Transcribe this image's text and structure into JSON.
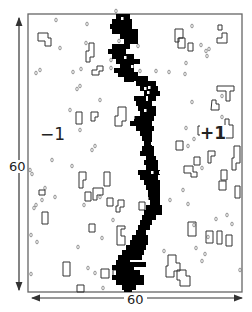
{
  "figure": {
    "width_label": "60",
    "height_label": "60",
    "left_region_label": "−1",
    "right_region_label": "+1",
    "frame": {
      "x": 28,
      "y": 14,
      "w": 214,
      "h": 278
    },
    "colors": {
      "frame": "#666666",
      "cluster": "#000000",
      "outline": "#333333",
      "dot": "#777777",
      "arrow": "#333333"
    }
  },
  "cluster_cells": [
    [
      116,
      14,
      14,
      5
    ],
    [
      112,
      19,
      20,
      5
    ],
    [
      110,
      24,
      22,
      5
    ],
    [
      112,
      29,
      26,
      5
    ],
    [
      120,
      34,
      18,
      5
    ],
    [
      124,
      39,
      14,
      5
    ],
    [
      112,
      44,
      18,
      5
    ],
    [
      108,
      49,
      18,
      5
    ],
    [
      112,
      54,
      22,
      5
    ],
    [
      116,
      59,
      24,
      5
    ],
    [
      120,
      64,
      14,
      5
    ],
    [
      114,
      68,
      20,
      5
    ],
    [
      118,
      72,
      20,
      5
    ],
    [
      124,
      77,
      10,
      5
    ],
    [
      132,
      76,
      16,
      5
    ],
    [
      136,
      81,
      20,
      5
    ],
    [
      140,
      86,
      18,
      5
    ],
    [
      144,
      91,
      16,
      5
    ],
    [
      134,
      96,
      12,
      5
    ],
    [
      148,
      96,
      8,
      5
    ],
    [
      136,
      101,
      16,
      5
    ],
    [
      138,
      106,
      18,
      5
    ],
    [
      140,
      111,
      16,
      5
    ],
    [
      134,
      116,
      20,
      5
    ],
    [
      130,
      121,
      22,
      5
    ],
    [
      136,
      126,
      18,
      5
    ],
    [
      140,
      131,
      12,
      5
    ],
    [
      142,
      136,
      10,
      5
    ],
    [
      144,
      141,
      8,
      5
    ],
    [
      142,
      146,
      12,
      5
    ],
    [
      140,
      151,
      14,
      5
    ],
    [
      146,
      156,
      10,
      5
    ],
    [
      144,
      160,
      14,
      5
    ],
    [
      146,
      165,
      12,
      5
    ],
    [
      138,
      170,
      22,
      5
    ],
    [
      140,
      175,
      18,
      5
    ],
    [
      144,
      180,
      16,
      5
    ],
    [
      146,
      185,
      14,
      5
    ],
    [
      148,
      190,
      12,
      5
    ],
    [
      148,
      195,
      12,
      5
    ],
    [
      150,
      200,
      10,
      5
    ],
    [
      146,
      205,
      16,
      5
    ],
    [
      144,
      210,
      18,
      5
    ],
    [
      142,
      215,
      14,
      5
    ],
    [
      140,
      220,
      12,
      5
    ],
    [
      138,
      225,
      12,
      5
    ],
    [
      136,
      230,
      10,
      5
    ],
    [
      132,
      235,
      16,
      5
    ],
    [
      130,
      240,
      18,
      5
    ],
    [
      126,
      245,
      20,
      5
    ],
    [
      122,
      250,
      22,
      5
    ],
    [
      118,
      255,
      24,
      5
    ],
    [
      116,
      260,
      14,
      5
    ],
    [
      128,
      262,
      18,
      5
    ],
    [
      112,
      265,
      22,
      5
    ],
    [
      116,
      270,
      24,
      5
    ],
    [
      112,
      275,
      32,
      5
    ],
    [
      116,
      280,
      28,
      5
    ],
    [
      122,
      285,
      14,
      5
    ],
    [
      124,
      289,
      8,
      3
    ]
  ],
  "cluster_holes": [
    [
      121,
      17
    ],
    [
      124,
      56
    ],
    [
      131,
      65
    ],
    [
      144,
      87
    ],
    [
      148,
      86
    ],
    [
      147,
      91
    ],
    [
      132,
      116
    ],
    [
      144,
      109
    ],
    [
      151,
      142
    ],
    [
      151,
      171
    ],
    [
      159,
      171
    ],
    [
      142,
      197
    ],
    [
      146,
      197
    ]
  ],
  "outlines": [
    [
      [
        38,
        33
      ],
      [
        48,
        33
      ],
      [
        48,
        38
      ],
      [
        51,
        38
      ],
      [
        51,
        46
      ],
      [
        45,
        46
      ],
      [
        45,
        41
      ],
      [
        38,
        41
      ]
    ],
    [
      [
        89,
        43
      ],
      [
        94,
        43
      ],
      [
        94,
        57
      ],
      [
        90,
        57
      ],
      [
        90,
        62
      ],
      [
        86,
        62
      ],
      [
        86,
        51
      ],
      [
        89,
        51
      ]
    ],
    [
      [
        97,
        66
      ],
      [
        103,
        66
      ],
      [
        103,
        71
      ],
      [
        99,
        71
      ],
      [
        99,
        75
      ],
      [
        92,
        75
      ],
      [
        92,
        70
      ],
      [
        97,
        70
      ]
    ],
    [
      [
        76,
        112
      ],
      [
        82,
        112
      ],
      [
        82,
        124
      ],
      [
        76,
        124
      ]
    ],
    [
      [
        91,
        112
      ],
      [
        98,
        112
      ],
      [
        98,
        117
      ],
      [
        95,
        117
      ],
      [
        95,
        121
      ],
      [
        91,
        121
      ]
    ],
    [
      [
        118,
        107
      ],
      [
        126,
        107
      ],
      [
        126,
        121
      ],
      [
        122,
        121
      ],
      [
        122,
        126
      ],
      [
        115,
        126
      ],
      [
        115,
        116
      ],
      [
        118,
        116
      ]
    ],
    [
      [
        175,
        29
      ],
      [
        183,
        29
      ],
      [
        183,
        38
      ],
      [
        179,
        38
      ],
      [
        179,
        42
      ],
      [
        175,
        42
      ]
    ],
    [
      [
        188,
        43
      ],
      [
        193,
        43
      ],
      [
        193,
        51
      ],
      [
        188,
        51
      ]
    ],
    [
      [
        178,
        38
      ],
      [
        185,
        38
      ],
      [
        185,
        48
      ],
      [
        178,
        48
      ]
    ],
    [
      [
        218,
        25
      ],
      [
        222,
        25
      ],
      [
        222,
        30
      ],
      [
        218,
        30
      ]
    ],
    [
      [
        222,
        33
      ],
      [
        227,
        33
      ],
      [
        227,
        43
      ],
      [
        217,
        43
      ],
      [
        217,
        38
      ],
      [
        222,
        38
      ]
    ],
    [
      [
        217,
        86
      ],
      [
        234,
        86
      ],
      [
        234,
        91
      ],
      [
        230,
        91
      ],
      [
        230,
        101
      ],
      [
        226,
        101
      ],
      [
        226,
        91
      ],
      [
        217,
        91
      ]
    ],
    [
      [
        212,
        100
      ],
      [
        216,
        100
      ],
      [
        216,
        104
      ],
      [
        219,
        104
      ],
      [
        219,
        110
      ],
      [
        211,
        110
      ]
    ],
    [
      [
        198,
        126
      ],
      [
        205,
        126
      ],
      [
        205,
        130
      ],
      [
        201,
        130
      ],
      [
        201,
        135
      ],
      [
        198,
        135
      ]
    ],
    [
      [
        225,
        119
      ],
      [
        229,
        119
      ],
      [
        229,
        125
      ],
      [
        233,
        125
      ],
      [
        233,
        138
      ],
      [
        225,
        138
      ],
      [
        225,
        133
      ],
      [
        222,
        133
      ],
      [
        222,
        126
      ],
      [
        225,
        126
      ]
    ],
    [
      [
        176,
        141
      ],
      [
        183,
        141
      ],
      [
        183,
        150
      ],
      [
        176,
        150
      ]
    ],
    [
      [
        208,
        151
      ],
      [
        215,
        151
      ],
      [
        215,
        156
      ],
      [
        211,
        156
      ],
      [
        211,
        163
      ],
      [
        208,
        163
      ]
    ],
    [
      [
        194,
        157
      ],
      [
        200,
        157
      ],
      [
        200,
        165
      ],
      [
        194,
        165
      ]
    ],
    [
      [
        234,
        146
      ],
      [
        240,
        146
      ],
      [
        240,
        163
      ],
      [
        236,
        163
      ],
      [
        236,
        170
      ],
      [
        232,
        170
      ],
      [
        232,
        158
      ],
      [
        234,
        158
      ]
    ],
    [
      [
        104,
        172
      ],
      [
        110,
        172
      ],
      [
        110,
        186
      ],
      [
        104,
        186
      ]
    ],
    [
      [
        39,
        190
      ],
      [
        45,
        190
      ],
      [
        45,
        195
      ],
      [
        39,
        195
      ]
    ],
    [
      [
        118,
        200
      ],
      [
        124,
        200
      ],
      [
        124,
        207
      ],
      [
        120,
        207
      ],
      [
        120,
        212
      ],
      [
        116,
        212
      ],
      [
        116,
        206
      ],
      [
        118,
        206
      ]
    ],
    [
      [
        42,
        212
      ],
      [
        48,
        212
      ],
      [
        48,
        224
      ],
      [
        42,
        224
      ]
    ],
    [
      [
        79,
        172
      ],
      [
        86,
        172
      ],
      [
        86,
        180
      ],
      [
        83,
        180
      ],
      [
        83,
        188
      ],
      [
        79,
        188
      ]
    ],
    [
      [
        85,
        192
      ],
      [
        91,
        192
      ],
      [
        91,
        201
      ],
      [
        85,
        201
      ]
    ],
    [
      [
        93,
        188
      ],
      [
        103,
        188
      ],
      [
        103,
        195
      ],
      [
        97,
        195
      ],
      [
        97,
        200
      ],
      [
        93,
        200
      ]
    ],
    [
      [
        107,
        198
      ],
      [
        113,
        198
      ],
      [
        113,
        206
      ],
      [
        107,
        206
      ]
    ],
    [
      [
        117,
        226
      ],
      [
        125,
        226
      ],
      [
        125,
        229
      ],
      [
        121,
        229
      ],
      [
        121,
        236
      ],
      [
        125,
        236
      ],
      [
        125,
        245
      ],
      [
        117,
        245
      ]
    ],
    [
      [
        139,
        202
      ],
      [
        145,
        202
      ],
      [
        145,
        210
      ],
      [
        139,
        210
      ]
    ],
    [
      [
        184,
        166
      ],
      [
        193,
        166
      ],
      [
        193,
        172
      ],
      [
        197,
        172
      ],
      [
        197,
        177
      ],
      [
        191,
        177
      ],
      [
        191,
        173
      ],
      [
        184,
        173
      ]
    ],
    [
      [
        221,
        170
      ],
      [
        227,
        170
      ],
      [
        227,
        180
      ],
      [
        221,
        180
      ]
    ],
    [
      [
        219,
        181
      ],
      [
        226,
        181
      ],
      [
        226,
        190
      ],
      [
        219,
        190
      ]
    ],
    [
      [
        235,
        186
      ],
      [
        240,
        186
      ],
      [
        240,
        198
      ],
      [
        235,
        198
      ]
    ],
    [
      [
        188,
        222
      ],
      [
        196,
        222
      ],
      [
        196,
        236
      ],
      [
        188,
        236
      ]
    ],
    [
      [
        206,
        231
      ],
      [
        213,
        231
      ],
      [
        213,
        243
      ],
      [
        206,
        243
      ]
    ],
    [
      [
        217,
        231
      ],
      [
        222,
        231
      ],
      [
        222,
        244
      ],
      [
        217,
        244
      ]
    ],
    [
      [
        226,
        235
      ],
      [
        232,
        235
      ],
      [
        232,
        246
      ],
      [
        226,
        246
      ]
    ],
    [
      [
        168,
        255
      ],
      [
        176,
        255
      ],
      [
        176,
        263
      ],
      [
        180,
        263
      ],
      [
        180,
        271
      ],
      [
        174,
        271
      ],
      [
        174,
        277
      ],
      [
        166,
        277
      ],
      [
        166,
        266
      ],
      [
        168,
        266
      ]
    ],
    [
      [
        177,
        270
      ],
      [
        186,
        270
      ],
      [
        186,
        276
      ],
      [
        190,
        276
      ],
      [
        190,
        286
      ],
      [
        180,
        286
      ],
      [
        180,
        280
      ],
      [
        177,
        280
      ]
    ],
    [
      [
        89,
        224
      ],
      [
        95,
        224
      ],
      [
        95,
        232
      ],
      [
        89,
        232
      ]
    ],
    [
      [
        63,
        262
      ],
      [
        70,
        262
      ],
      [
        70,
        276
      ],
      [
        63,
        276
      ]
    ],
    [
      [
        101,
        269
      ],
      [
        109,
        269
      ],
      [
        109,
        278
      ],
      [
        101,
        278
      ]
    ],
    [
      [
        113,
        270
      ],
      [
        120,
        270
      ],
      [
        120,
        279
      ],
      [
        113,
        279
      ]
    ],
    [
      [
        120,
        264
      ],
      [
        125,
        264
      ],
      [
        125,
        272
      ],
      [
        120,
        272
      ]
    ],
    [
      [
        77,
        285
      ],
      [
        84,
        285
      ],
      [
        84,
        292
      ],
      [
        77,
        292
      ]
    ]
  ],
  "dots": [
    [
      56,
      20
    ],
    [
      87,
      24
    ],
    [
      60,
      48
    ],
    [
      86,
      43
    ],
    [
      40,
      70
    ],
    [
      36,
      73
    ],
    [
      73,
      72
    ],
    [
      81,
      69
    ],
    [
      77,
      89
    ],
    [
      80,
      86
    ],
    [
      100,
      100
    ],
    [
      70,
      110
    ],
    [
      80,
      130
    ],
    [
      95,
      146
    ],
    [
      72,
      166
    ],
    [
      52,
      160
    ],
    [
      30,
      170
    ],
    [
      32,
      174
    ],
    [
      45,
      188
    ],
    [
      42,
      200
    ],
    [
      36,
      205
    ],
    [
      34,
      208
    ],
    [
      55,
      197
    ],
    [
      84,
      205
    ],
    [
      100,
      197
    ],
    [
      113,
      220
    ],
    [
      31,
      235
    ],
    [
      37,
      242
    ],
    [
      78,
      247
    ],
    [
      102,
      238
    ],
    [
      88,
      268
    ],
    [
      95,
      273
    ],
    [
      31,
      274
    ],
    [
      103,
      288
    ],
    [
      92,
      150
    ],
    [
      116,
      11
    ],
    [
      117,
      48
    ],
    [
      119,
      41
    ],
    [
      111,
      60
    ],
    [
      111,
      68
    ],
    [
      138,
      46
    ],
    [
      140,
      71
    ],
    [
      156,
      71
    ],
    [
      192,
      26
    ],
    [
      201,
      45
    ],
    [
      206,
      51
    ],
    [
      207,
      56
    ],
    [
      209,
      49
    ],
    [
      186,
      63
    ],
    [
      169,
      72
    ],
    [
      185,
      74
    ],
    [
      192,
      102
    ],
    [
      222,
      96
    ],
    [
      222,
      117
    ],
    [
      186,
      128
    ],
    [
      194,
      139
    ],
    [
      188,
      146
    ],
    [
      170,
      200
    ],
    [
      183,
      190
    ],
    [
      194,
      225
    ],
    [
      196,
      248
    ],
    [
      208,
      237
    ],
    [
      227,
      215
    ],
    [
      232,
      224
    ],
    [
      205,
      254
    ],
    [
      216,
      219
    ],
    [
      202,
      261
    ],
    [
      240,
      270
    ],
    [
      164,
      251
    ],
    [
      202,
      168
    ],
    [
      145,
      118
    ],
    [
      188,
      204
    ]
  ]
}
